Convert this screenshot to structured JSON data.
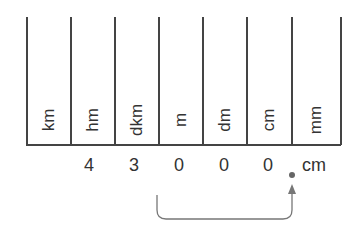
{
  "diagram": {
    "columns": [
      "km",
      "hm",
      "dkm",
      "m",
      "dm",
      "cm",
      "mm"
    ],
    "digits": [
      "",
      "4",
      "3",
      "0",
      "0",
      "0",
      ""
    ],
    "decimal_point": ".",
    "result_unit": "cm",
    "arrow": {
      "from_column": "m",
      "to": "decimal point between cm and mm"
    },
    "colors": {
      "lines": "#444444",
      "text": "#333333",
      "arrow": "#777777"
    }
  }
}
